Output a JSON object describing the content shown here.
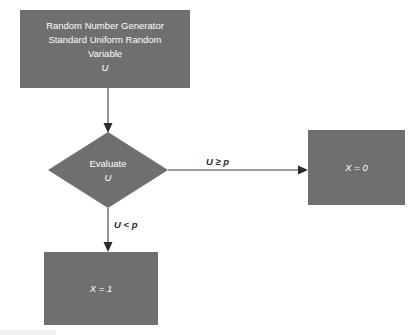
{
  "diagram": {
    "colors": {
      "node_fill": "#6f6f6f",
      "node_text": "#ffffff",
      "connector": "#3a3a3a",
      "label_text": "#2b2b2b",
      "background": "#ffffff"
    },
    "nodes": {
      "generator": {
        "shape": "rectangle",
        "line1": "Random Number Generator",
        "line2": "Standard Uniform Random",
        "line3": "Variable",
        "line4": "U"
      },
      "decision": {
        "shape": "diamond",
        "line1": "Evaluate",
        "line2": "U"
      },
      "outcome_zero": {
        "shape": "rectangle",
        "label": "X = 0"
      },
      "outcome_one": {
        "shape": "rectangle",
        "label": "X = 1"
      }
    },
    "edges": {
      "generator_to_decision": {
        "label": ""
      },
      "decision_to_zero": {
        "label": "U ≥ p"
      },
      "decision_to_one": {
        "label": "U < p"
      }
    }
  }
}
